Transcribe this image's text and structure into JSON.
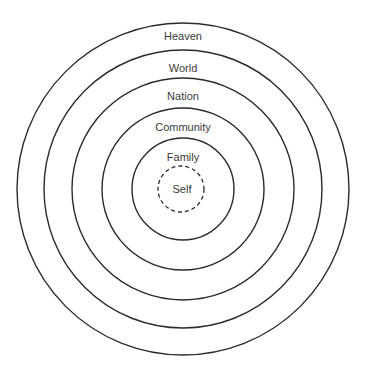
{
  "diagram": {
    "type": "concentric-circles",
    "center": {
      "x": 183,
      "y": 189
    },
    "rings": [
      {
        "label": "Heaven",
        "radius": 166,
        "label_y": 37,
        "style": "solid"
      },
      {
        "label": "World",
        "radius": 139,
        "label_y": 69,
        "style": "solid"
      },
      {
        "label": "Nation",
        "radius": 111,
        "label_y": 97,
        "style": "solid"
      },
      {
        "label": "Community",
        "radius": 81,
        "label_y": 128,
        "style": "solid"
      },
      {
        "label": "Family",
        "radius": 51,
        "label_y": 158,
        "style": "solid"
      },
      {
        "label": "Self",
        "radius": 23,
        "label_y": 189,
        "style": "dashed"
      }
    ],
    "stroke_color": "#2b2b2b",
    "text_color": "#3a3a3a"
  }
}
